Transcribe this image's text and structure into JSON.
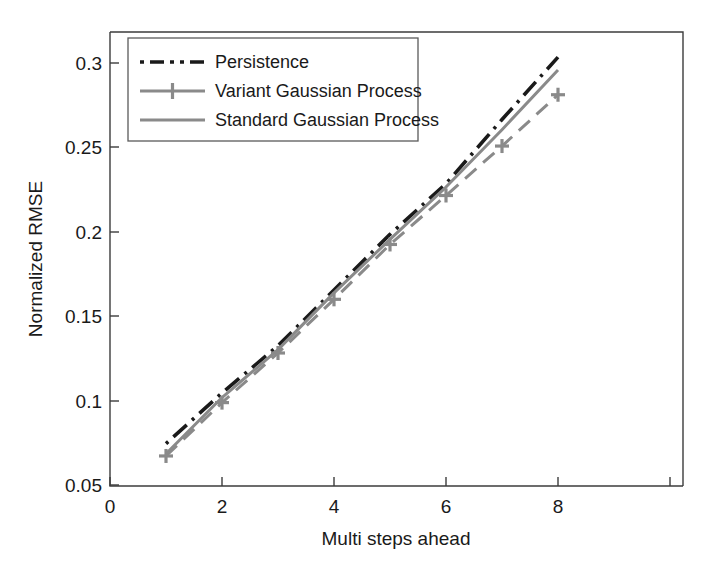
{
  "chart_data": {
    "type": "line",
    "title": "",
    "xlabel": "Multi steps ahead",
    "ylabel": "Normalized RMSE",
    "xlim": [
      0,
      8.8
    ],
    "ylim": [
      0.05,
      0.315
    ],
    "xticks": [
      0,
      2,
      4,
      6,
      8
    ],
    "xtick_labels": [
      "0",
      "2",
      "4",
      "6",
      "8"
    ],
    "yticks": [
      0.05,
      0.1,
      0.15,
      0.2,
      0.25,
      0.3
    ],
    "ytick_labels": [
      "0.05",
      "0.1",
      "0.15",
      "0.2",
      "0.25",
      "0.3"
    ],
    "grid": false,
    "legend_position": "upper-left",
    "x": [
      1,
      2,
      3,
      4,
      5,
      6,
      7,
      8
    ],
    "series": [
      {
        "name": "Persistence",
        "values": [
          0.0745,
          0.1045,
          0.1325,
          0.1655,
          0.1985,
          0.2285,
          0.2665,
          0.3035
        ],
        "color": "#1a1a1a",
        "linestyle": "dash-dot",
        "marker": "none"
      },
      {
        "name": "Variant Gaussian Process",
        "values": [
          0.0672,
          0.0988,
          0.1282,
          0.16,
          0.1925,
          0.2215,
          0.2508,
          0.2812
        ],
        "color": "#8a8a8a",
        "linestyle": "dashed",
        "marker": "plus"
      },
      {
        "name": "Standard Gaussian Process",
        "values": [
          0.0685,
          0.1018,
          0.1302,
          0.1638,
          0.1955,
          0.2265,
          0.2605,
          0.2958
        ],
        "color": "#8a8a8a",
        "linestyle": "solid",
        "marker": "none"
      }
    ]
  },
  "legend": {
    "entries": [
      {
        "label": "Persistence"
      },
      {
        "label": "Variant Gaussian Process"
      },
      {
        "label": "Standard Gaussian Process"
      }
    ]
  },
  "colors": {
    "persistence": "#1a1a1a",
    "gaussian_gray": "#8a8a8a",
    "axis": "#3c3c3c",
    "background": "#ffffff"
  }
}
